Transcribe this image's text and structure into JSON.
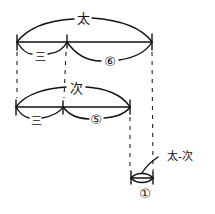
{
  "diagram": {
    "top_bar": {
      "total_label": "太",
      "left_segment_label": "三",
      "right_segment_label": "⑥"
    },
    "middle_bar": {
      "total_label": "次",
      "left_segment_label": "三",
      "right_segment_label": "⑤"
    },
    "difference_bar": {
      "callout_label": "太-次",
      "segment_label": "①"
    }
  }
}
